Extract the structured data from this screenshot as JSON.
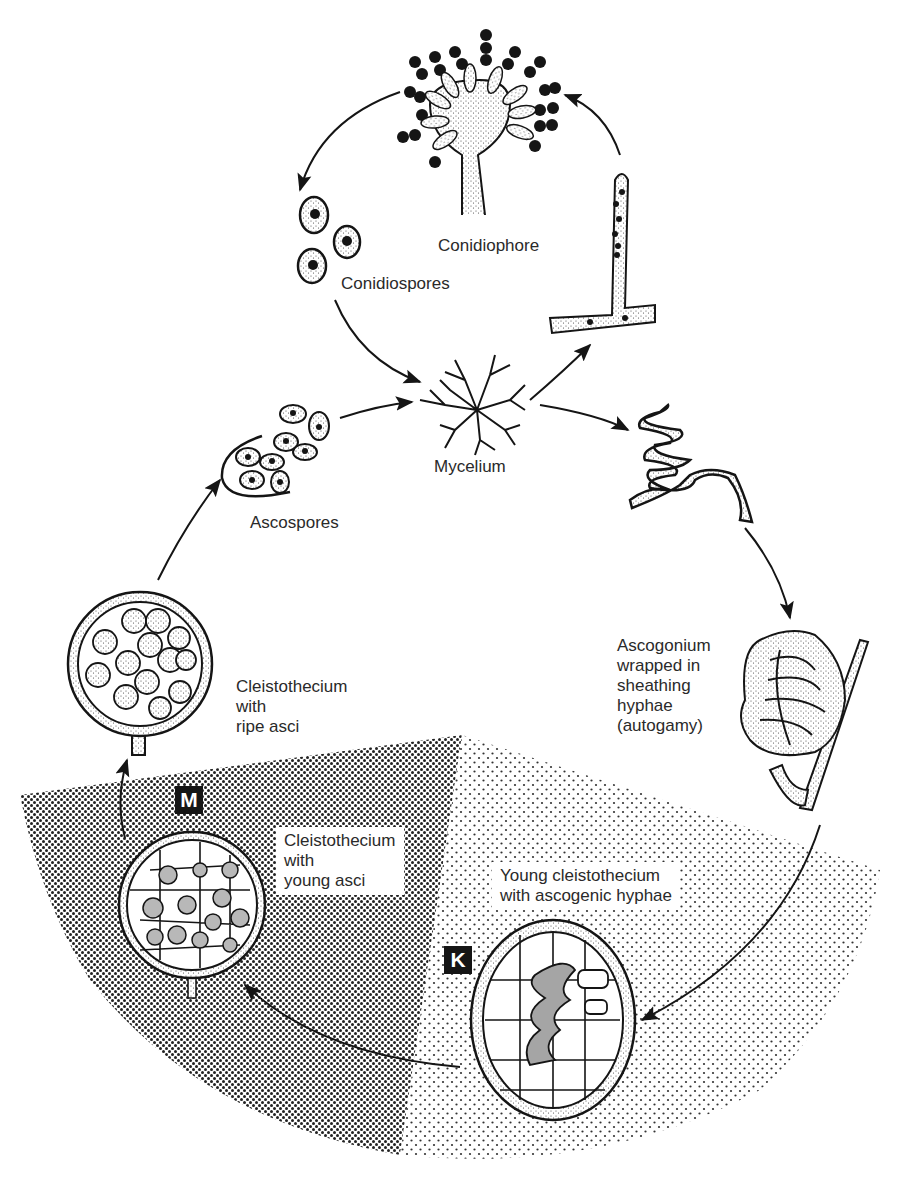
{
  "diagram": {
    "type": "life-cycle",
    "colors": {
      "ink": "#151515",
      "paper": "#ffffff",
      "dense_shade": "#6a6a6a",
      "light_shade": "#b5b5b5"
    },
    "nodes": [
      {
        "id": "conidiophore",
        "label": "Conidiophore"
      },
      {
        "id": "conidiospores",
        "label": "Conidiospores"
      },
      {
        "id": "mycelium",
        "label": "Mycelium"
      },
      {
        "id": "ascospores",
        "label": "Ascospores"
      },
      {
        "id": "ascogonium",
        "label": "Ascogonium\nwrapped in\nsheathing\nhyphae\n(autogamy)"
      },
      {
        "id": "cleisto_ripe",
        "label": "Cleistothecium\nwith\nripe asci"
      },
      {
        "id": "cleisto_young_asci",
        "label": "Cleistothecium\nwith\nyoung asci"
      },
      {
        "id": "cleisto_young",
        "label": "Young cleistothecium\nwith ascogenic hyphae"
      }
    ],
    "markers": [
      {
        "id": "M",
        "label": "M"
      },
      {
        "id": "K",
        "label": "K"
      }
    ],
    "edges": [
      [
        "mycelium",
        "branch-hypha"
      ],
      [
        "branch-hypha",
        "conidiophore"
      ],
      [
        "conidiophore",
        "conidiospores"
      ],
      [
        "conidiospores",
        "mycelium"
      ],
      [
        "mycelium",
        "coiled-hypha"
      ],
      [
        "coiled-hypha",
        "ascogonium"
      ],
      [
        "ascogonium",
        "cleisto_young"
      ],
      [
        "cleisto_young",
        "cleisto_young_asci"
      ],
      [
        "cleisto_young_asci",
        "cleisto_ripe"
      ],
      [
        "cleisto_ripe",
        "ascospores"
      ],
      [
        "ascospores",
        "mycelium"
      ]
    ]
  }
}
